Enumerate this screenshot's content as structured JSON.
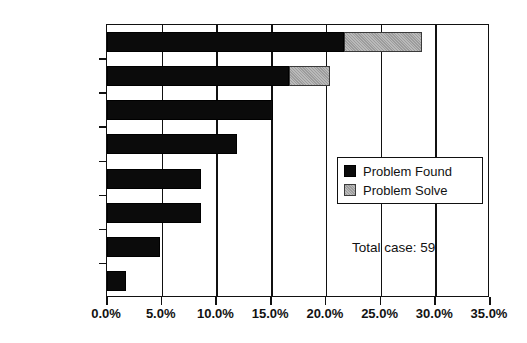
{
  "chart_data": {
    "type": "bar",
    "orientation": "horizontal",
    "stacked": true,
    "title": "",
    "xlabel": "",
    "ylabel": "",
    "xlim": [
      0,
      35
    ],
    "xticks": [
      0,
      5,
      10,
      15,
      20,
      25,
      30,
      35
    ],
    "xtick_labels": [
      "0.0%",
      "5.0%",
      "10.0%",
      "15.0%",
      "20.0%",
      "25.0%",
      "30.0%",
      "35.0%"
    ],
    "grid": true,
    "grid_axis": "x",
    "legend_position": "center-right",
    "categories": [
      "Problem A",
      "Problem B",
      "Problem C",
      "Problem D",
      "Problem E",
      "Problem F",
      "Problem G",
      "Problem H"
    ],
    "series": [
      {
        "name": "Problem Found",
        "color": "#0b0b0b",
        "values": [
          21.7,
          16.6,
          15.2,
          11.9,
          8.6,
          8.6,
          4.8,
          1.7
        ]
      },
      {
        "name": "Problem Solve",
        "color": "#9c9c9c",
        "values": [
          7.1,
          3.8,
          0,
          0,
          0,
          0,
          0,
          0
        ]
      }
    ],
    "annotations": [
      {
        "name": "total-case",
        "text": "Total case: 59"
      }
    ]
  },
  "legend": {
    "entries": [
      {
        "label": "Problem Found",
        "swatch": "black-square-icon"
      },
      {
        "label": "Problem Solve",
        "swatch": "gray-square-icon"
      }
    ]
  },
  "annotation": {
    "total_case": "Total case: 59"
  },
  "colors": {
    "found": "#0b0b0b",
    "solve": "#9c9c9c",
    "axis": "#111111",
    "background": "#ffffff"
  }
}
